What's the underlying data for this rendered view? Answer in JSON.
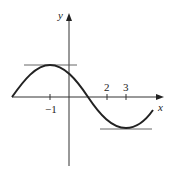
{
  "figure": {
    "axes": {
      "x_label": "x",
      "y_label": "y",
      "x_ticks": [
        {
          "value": -1,
          "label": "−1"
        },
        {
          "value": 2,
          "label": "2"
        },
        {
          "value": 3,
          "label": "3"
        }
      ]
    },
    "features": {
      "maximum_at_x": -1,
      "minimum_at_x": 3,
      "horizontal_tangents": [
        "at maximum (x = -1)",
        "at minimum (x = 3)"
      ]
    },
    "colors": {
      "curve": "#222222",
      "axes": "#333333",
      "tangent_lines": "#555555"
    }
  }
}
